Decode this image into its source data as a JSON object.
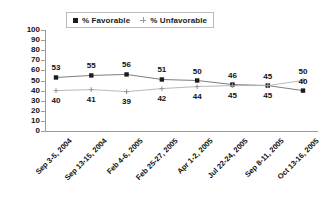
{
  "chart_data": {
    "type": "line",
    "title": "",
    "xlabel": "",
    "ylabel": "",
    "ylim": [
      0,
      100
    ],
    "ytick_step": 10,
    "grid": false,
    "legend_position": "top-center",
    "categories": [
      "Sep 3-5, 2004",
      "Sep 13-15, 2004",
      "Feb 4-6, 2005",
      "Feb 25-27, 2005",
      "Apr 1-2, 2005",
      "Jul 22-24, 2005",
      "Sep 8-11, 2005",
      "Oct 13-16, 2005"
    ],
    "yticks": [
      "100",
      "90",
      "80",
      "70",
      "60",
      "50",
      "40",
      "30",
      "20",
      "10",
      "0"
    ],
    "series": [
      {
        "name": "% Favorable",
        "marker": "square",
        "color": "#1c1c1c",
        "line_color": "#6e6e6e",
        "values": [
          53,
          55,
          56,
          51,
          50,
          46,
          45,
          40
        ],
        "label_offsets": [
          "above",
          "above",
          "above",
          "above",
          "above",
          "above",
          "above",
          "above"
        ]
      },
      {
        "name": "% Unfavorable",
        "marker": "cross",
        "color": "#9a9a9a",
        "line_color": "#b0b0b0",
        "values": [
          40,
          41,
          39,
          42,
          44,
          45,
          45,
          50
        ],
        "label_offsets": [
          "below",
          "below",
          "below",
          "below",
          "below",
          "below",
          "below",
          "above"
        ]
      }
    ]
  },
  "legend": {
    "items": [
      {
        "label": "% Favorable",
        "marker": "square-marker"
      },
      {
        "label": "% Unfavorable",
        "marker": "cross-marker"
      }
    ]
  }
}
